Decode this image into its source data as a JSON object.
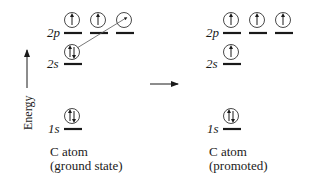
{
  "axis": {
    "label": "Energy"
  },
  "levels": {
    "2p": "2p",
    "2s": "2s",
    "1s": "1s"
  },
  "ground_state": {
    "caption_line1": "C atom",
    "caption_line2": "(ground state)",
    "orbitals": {
      "2p": [
        "up",
        "up",
        "empty"
      ],
      "2s": [
        "paired"
      ],
      "1s": [
        "paired"
      ]
    },
    "promotion_arrow": "2s electron promoted to empty 2p orbital"
  },
  "promoted": {
    "caption_line1": "C atom",
    "caption_line2": "(promoted)",
    "orbitals": {
      "2p": [
        "up",
        "up",
        "up"
      ],
      "2s": [
        "up"
      ],
      "1s": [
        "paired"
      ]
    }
  },
  "colors": {
    "ink": "#1a1a1a",
    "arrow": "#555555"
  }
}
